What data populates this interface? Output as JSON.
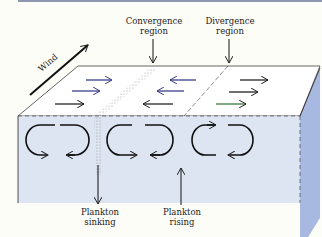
{
  "diagram": {
    "labels": {
      "wind": "Wind",
      "convergence": [
        "Convergence",
        "region"
      ],
      "divergence": [
        "Divergence",
        "region"
      ],
      "sinking": [
        "Plankton",
        "sinking"
      ],
      "rising": [
        "Plankton",
        "rising"
      ]
    },
    "colors": {
      "front_face": "#dfe6f2",
      "side_face": "#a7b9e0",
      "top_face": "#ffffff",
      "arrow_blue": "#3a3f8a",
      "arrow_dark": "#222222",
      "arrow_green": "#3a7a3a",
      "stipple": "#b0b0b0"
    }
  }
}
